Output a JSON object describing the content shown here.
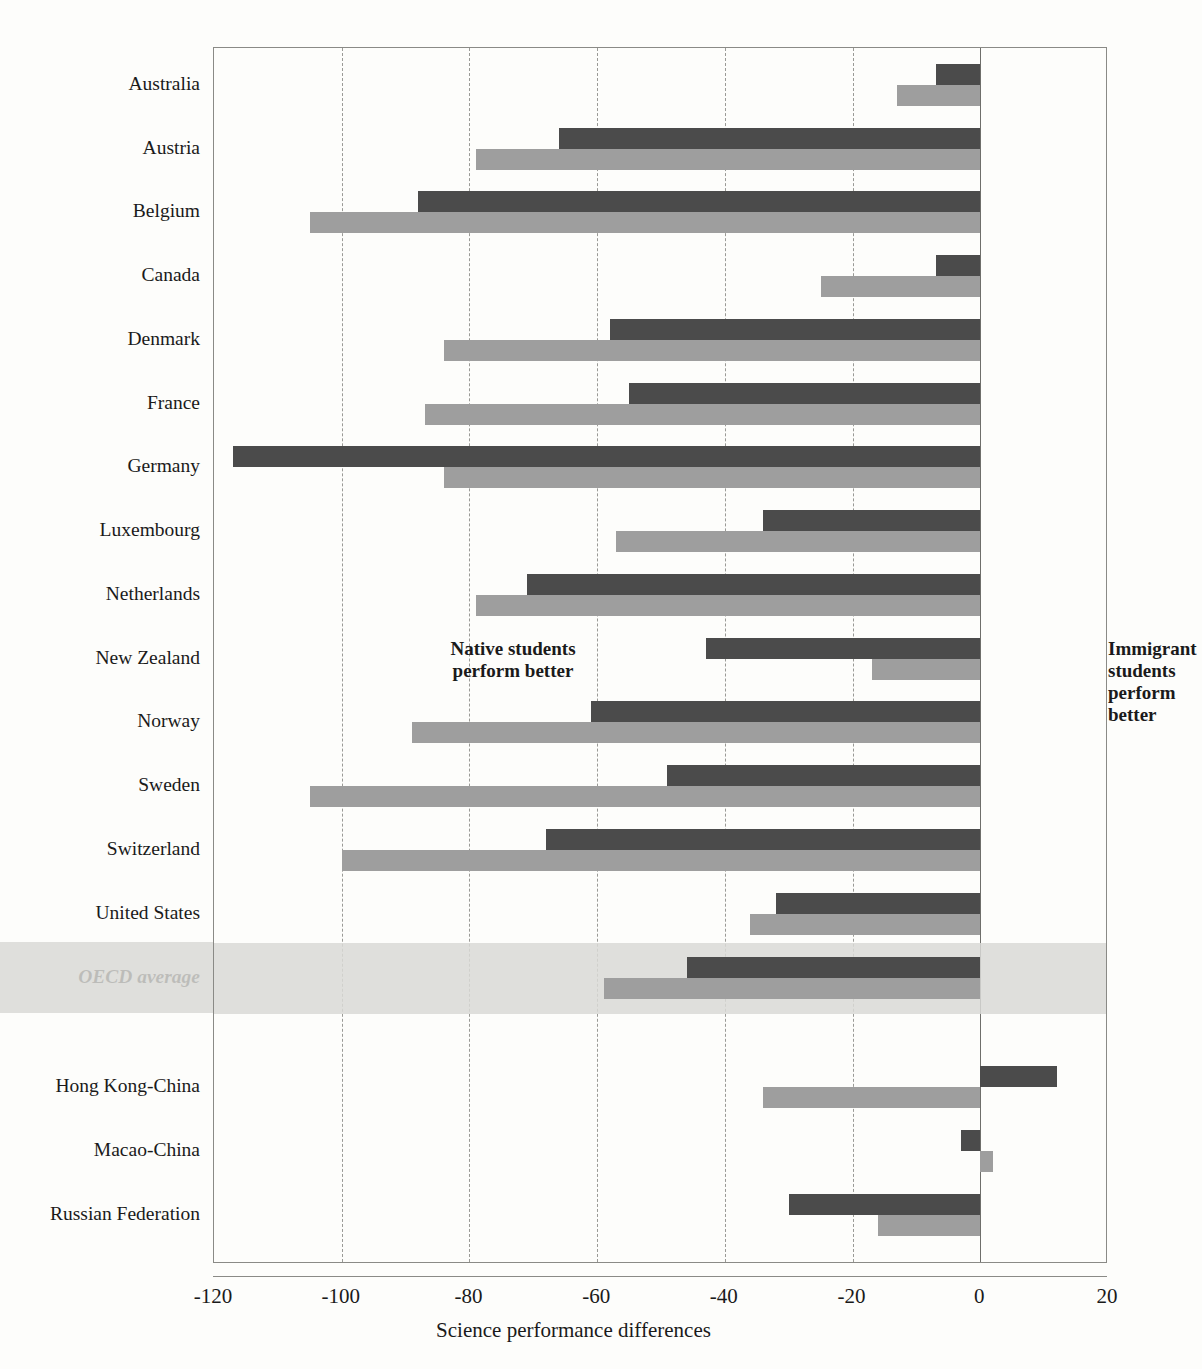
{
  "chart_data": {
    "type": "bar",
    "orientation": "horizontal",
    "title": "",
    "xlabel": "Science performance differences",
    "ylabel": "",
    "xlim": [
      -120,
      20
    ],
    "xticks": [
      -120,
      -100,
      -80,
      -60,
      -40,
      -20,
      0,
      20
    ],
    "xtick_labels": [
      "-120",
      "-100",
      "-80",
      "-60",
      "-40",
      "-20",
      "0",
      "20"
    ],
    "grid": "vertical-dashed",
    "legend": [],
    "annotations": [
      {
        "id": "native",
        "text_line1": "Native students",
        "text_line2": "perform better"
      },
      {
        "id": "immigrant",
        "text_line1": "Immigrant",
        "text_line2": "students",
        "text_line3": "perform",
        "text_line4": "better"
      }
    ],
    "series": [
      {
        "name": "first-generation",
        "color": "#4b4b4b"
      },
      {
        "name": "second-generation",
        "color": "#9e9e9e"
      }
    ],
    "categories": [
      "Australia",
      "Austria",
      "Belgium",
      "Canada",
      "Denmark",
      "France",
      "Germany",
      "Luxembourg",
      "Netherlands",
      "New Zealand",
      "Norway",
      "Sweden",
      "Switzerland",
      "United States",
      "OECD average",
      "Hong Kong-China",
      "Macao-China",
      "Russian Federation"
    ],
    "rows": [
      {
        "label": "Australia",
        "dark": -7,
        "light": -13,
        "group": "oecd",
        "highlight": false
      },
      {
        "label": "Austria",
        "dark": -66,
        "light": -79,
        "group": "oecd",
        "highlight": false
      },
      {
        "label": "Belgium",
        "dark": -88,
        "light": -105,
        "group": "oecd",
        "highlight": false
      },
      {
        "label": "Canada",
        "dark": -7,
        "light": -25,
        "group": "oecd",
        "highlight": false
      },
      {
        "label": "Denmark",
        "dark": -58,
        "light": -84,
        "group": "oecd",
        "highlight": false
      },
      {
        "label": "France",
        "dark": -55,
        "light": -87,
        "group": "oecd",
        "highlight": false
      },
      {
        "label": "Germany",
        "dark": -117,
        "light": -84,
        "group": "oecd",
        "highlight": false
      },
      {
        "label": "Luxembourg",
        "dark": -34,
        "light": -57,
        "group": "oecd",
        "highlight": false
      },
      {
        "label": "Netherlands",
        "dark": -71,
        "light": -79,
        "group": "oecd",
        "highlight": false
      },
      {
        "label": "New Zealand",
        "dark": -43,
        "light": -17,
        "group": "oecd",
        "highlight": false
      },
      {
        "label": "Norway",
        "dark": -61,
        "light": -89,
        "group": "oecd",
        "highlight": false
      },
      {
        "label": "Sweden",
        "dark": -49,
        "light": -105,
        "group": "oecd",
        "highlight": false
      },
      {
        "label": "Switzerland",
        "dark": -68,
        "light": -100,
        "group": "oecd",
        "highlight": false
      },
      {
        "label": "United States",
        "dark": -32,
        "light": -36,
        "group": "oecd",
        "highlight": false
      },
      {
        "label": "OECD average",
        "dark": -46,
        "light": -59,
        "group": "oecd",
        "highlight": true
      },
      {
        "label": "Hong Kong-China",
        "dark": 12,
        "light": -34,
        "group": "partner",
        "highlight": false
      },
      {
        "label": "Macao-China",
        "dark": -3,
        "light": 2,
        "group": "partner",
        "highlight": false
      },
      {
        "label": "Russian Federation",
        "dark": -30,
        "light": -16,
        "group": "partner",
        "highlight": false
      }
    ]
  },
  "axis": {
    "x_title": "Science performance differences",
    "ticks": [
      "-120",
      "-100",
      "-80",
      "-60",
      "-40",
      "-20",
      "0",
      "20"
    ]
  },
  "annotations": {
    "native": "Native students\nperform better",
    "native_l1": "Native students",
    "native_l2": "perform better",
    "immigrant_l1": "Immigrant",
    "immigrant_l2": "students",
    "immigrant_l3": "perform",
    "immigrant_l4": "better"
  },
  "colors": {
    "bar_dark": "#4b4b4b",
    "bar_light": "#9e9e9e",
    "band": "#d9d9d6",
    "frame": "#8a8a86",
    "grid": "#9a9a96"
  }
}
